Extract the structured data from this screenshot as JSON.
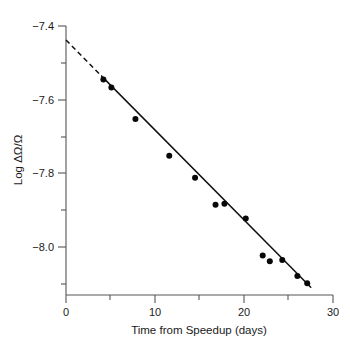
{
  "chart_data": {
    "type": "scatter",
    "title": "",
    "xlabel": "Time from Speedup (days)",
    "ylabel": "Log ΔΩ/Ω",
    "xlim": [
      0,
      30
    ],
    "ylim": [
      -8.12,
      -7.4
    ],
    "grid": false,
    "legend": null,
    "x_ticks_major": [
      0,
      10,
      20,
      30
    ],
    "x_tick_labels": [
      "0",
      "10",
      "20",
      "30"
    ],
    "x_ticks_minor": [
      5,
      15,
      25
    ],
    "y_ticks_major": [
      -7.4,
      -7.6,
      -7.8,
      -8.0
    ],
    "y_tick_labels": [
      "−7.4",
      "−7.6",
      "−7.8",
      "−8.0"
    ],
    "y_ticks_minor": [
      -7.5,
      -7.7,
      -7.9,
      -8.1
    ],
    "series": [
      {
        "name": "observations",
        "type": "scatter",
        "marker": "filled-circle",
        "color": "#080808",
        "x": [
          4.2,
          5.1,
          7.8,
          11.6,
          14.5,
          16.8,
          17.8,
          20.2,
          22.1,
          22.9,
          24.3,
          26.0,
          27.1
        ],
        "y": [
          -7.545,
          -7.567,
          -7.652,
          -7.752,
          -7.812,
          -7.885,
          -7.882,
          -7.922,
          -8.023,
          -8.038,
          -8.035,
          -8.078,
          -8.098
        ]
      },
      {
        "name": "linear fit (solid)",
        "type": "line",
        "style": "solid",
        "color": "#111111",
        "x": [
          4.0,
          27.5
        ],
        "y": [
          -7.536,
          -8.109
        ]
      },
      {
        "name": "linear fit extrapolation (dashed)",
        "type": "line",
        "style": "dashed",
        "color": "#111111",
        "x": [
          0.0,
          4.0
        ],
        "y": [
          -7.438,
          -7.536
        ]
      }
    ],
    "fit": {
      "intercept": -7.438,
      "slope_per_day": -0.0244
    }
  },
  "axes": {
    "x_title": "Time from Speedup (days)",
    "y_title": "Log ΔΩ/Ω"
  }
}
